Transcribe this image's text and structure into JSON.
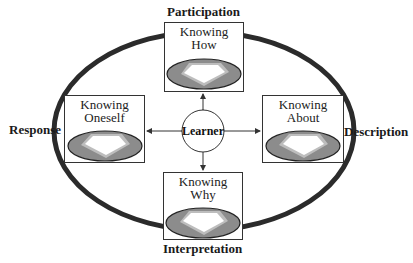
{
  "diagram": {
    "center": {
      "label": "Learner"
    },
    "nodes": [
      {
        "id": "top",
        "title_line1": "Knowing",
        "title_line2": "How",
        "outer_label": "Participation"
      },
      {
        "id": "left",
        "title_line1": "Knowing",
        "title_line2": "Oneself",
        "outer_label": "Response"
      },
      {
        "id": "right",
        "title_line1": "Knowing",
        "title_line2": "About",
        "outer_label": "Description"
      },
      {
        "id": "bottom",
        "title_line1": "Knowing",
        "title_line2": "Why",
        "outer_label": "Interpretation"
      }
    ],
    "colors": {
      "ring": "#2b2b2b",
      "ellipse_fill": "#8c8c8c",
      "ellipse_inner": "#bdbdbd",
      "box_border": "#333333"
    }
  }
}
